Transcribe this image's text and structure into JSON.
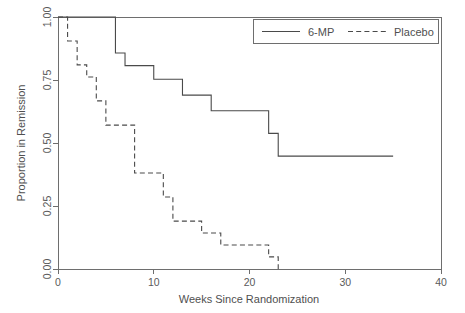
{
  "chart_data": {
    "type": "line",
    "subtype": "kaplan-meier-step",
    "title": "",
    "xlabel": "Weeks Since Randomization",
    "ylabel": "Proportion in Remission",
    "xlim": [
      0,
      40
    ],
    "ylim": [
      0.0,
      1.0
    ],
    "xticks": [
      0,
      10,
      20,
      30,
      40
    ],
    "xtick_labels": [
      "0",
      "10",
      "20",
      "30",
      "40"
    ],
    "yticks": [
      0.0,
      0.25,
      0.5,
      0.75,
      1.0
    ],
    "ytick_labels": [
      "0.00",
      "0.25",
      "0.50",
      "0.75",
      "1.00"
    ],
    "grid": false,
    "legend_position": "top-right",
    "series": [
      {
        "name": "6-MP",
        "style": "solid",
        "color": "#4a4a4a",
        "x": [
          0,
          6,
          7,
          10,
          13,
          16,
          22,
          23,
          35
        ],
        "y": [
          1.0,
          0.857,
          0.807,
          0.753,
          0.69,
          0.628,
          0.538,
          0.448,
          0.448
        ]
      },
      {
        "name": "Placebo",
        "style": "dashed",
        "color": "#4a4a4a",
        "x": [
          0,
          1,
          2,
          3,
          4,
          5,
          8,
          11,
          12,
          15,
          17,
          22,
          23
        ],
        "y": [
          1.0,
          0.905,
          0.81,
          0.762,
          0.667,
          0.571,
          0.381,
          0.286,
          0.19,
          0.143,
          0.095,
          0.048,
          0.0
        ]
      }
    ]
  },
  "legend": {
    "entries": [
      {
        "label": "6-MP",
        "style": "solid"
      },
      {
        "label": "Placebo",
        "style": "dashed"
      }
    ]
  },
  "axes": {
    "x_title": "Weeks Since Randomization",
    "y_title": "Proportion in Remission"
  }
}
